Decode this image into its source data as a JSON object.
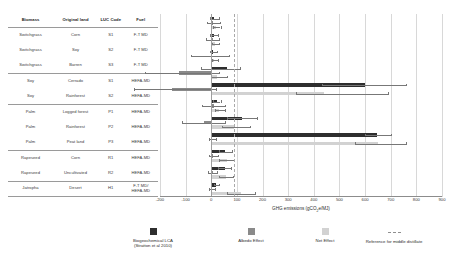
{
  "table": {
    "headers": [
      "Biomass",
      "Original land",
      "LUC Code",
      "Fuel"
    ],
    "rows": [
      {
        "biomass": "Switchgrass",
        "land": "Corn",
        "luc": "S1",
        "fuel": "F-T MD",
        "fuel2": ""
      },
      {
        "biomass": "Switchgrass",
        "land": "Soy",
        "luc": "S2",
        "fuel": "F-T MD",
        "fuel2": ""
      },
      {
        "biomass": "Switchgrass",
        "land": "Barren",
        "luc": "S3",
        "fuel": "F-T MD",
        "fuel2": ""
      },
      {
        "biomass": "Soy",
        "land": "Cerrado",
        "luc": "S1",
        "fuel": "HEFA-MD",
        "fuel2": ""
      },
      {
        "biomass": "Soy",
        "land": "Rainforest",
        "luc": "S2",
        "fuel": "HEFA-MD",
        "fuel2": ""
      },
      {
        "biomass": "Palm",
        "land": "Logged forest",
        "luc": "P1",
        "fuel": "HEFA-MD",
        "fuel2": ""
      },
      {
        "biomass": "Palm",
        "land": "Rainforest",
        "luc": "P2",
        "fuel": "HEFA-MD",
        "fuel2": ""
      },
      {
        "biomass": "Palm",
        "land": "Peat land",
        "luc": "P3",
        "fuel": "HEFA-MD",
        "fuel2": ""
      },
      {
        "biomass": "Rapeseed",
        "land": "Corn",
        "luc": "R1",
        "fuel": "HEFA-MD",
        "fuel2": ""
      },
      {
        "biomass": "Rapeseed",
        "land": "Uncultivated",
        "luc": "R2",
        "fuel": "HEFA-MD",
        "fuel2": ""
      },
      {
        "biomass": "Jatropha",
        "land": "Desert",
        "luc": "H1",
        "fuel": "F-T MD/",
        "fuel2": "HEFA-MD"
      }
    ]
  },
  "chart_data": {
    "type": "bar",
    "orientation": "horizontal",
    "title": "",
    "xlabel": "GHG emissions (gCO2e/MJ)",
    "xlabel_parts": {
      "pre": "GHG emissions (gCO",
      "sub": "2",
      "post": "e/MJ)"
    },
    "ylabel": "",
    "xlim": [
      -200,
      900
    ],
    "xticks": [
      -200,
      -100,
      0,
      100,
      200,
      300,
      400,
      500,
      600,
      700,
      800,
      900
    ],
    "grid": "vertical",
    "legend_position": "bottom",
    "reference_line": {
      "label": "Reference for middle distillate",
      "value": 90,
      "style": "dashed"
    },
    "categories": [
      "S1",
      "S2",
      "S3",
      "S1",
      "S2",
      "P1",
      "P2",
      "P3",
      "R1",
      "R2",
      "H1"
    ],
    "series": [
      {
        "name": "Biogeochemical LCA (Stratton et al 2010)",
        "color": "#2e2e2e",
        "values": [
          12,
          10,
          8,
          60,
          600,
          22,
          120,
          645,
          55,
          52,
          20
        ],
        "err_low": [
          -6,
          -4,
          -4,
          -40,
          430,
          8,
          60,
          600,
          30,
          28,
          10
        ],
        "err_high": [
          30,
          26,
          24,
          112,
          760,
          36,
          180,
          700,
          80,
          78,
          32
        ]
      },
      {
        "name": "Albedo Effect",
        "color": "#8a8a8a",
        "values": [
          8,
          6,
          4,
          -125,
          -155,
          10,
          -30,
          4,
          8,
          6,
          4
        ],
        "err_low": [
          -18,
          -20,
          -78,
          -260,
          -300,
          -38,
          -115,
          -10,
          -10,
          -12,
          -8
        ],
        "err_high": [
          34,
          32,
          70,
          30,
          20,
          55,
          52,
          18,
          26,
          24,
          16
        ]
      },
      {
        "name": "Net Effect",
        "color": "#d2d2d2",
        "values": [
          20,
          16,
          12,
          22,
          440,
          32,
          90,
          650,
          62,
          58,
          115
        ],
        "err_low": [
          6,
          4,
          2,
          0,
          330,
          14,
          40,
          560,
          32,
          30,
          60
        ],
        "err_high": [
          36,
          30,
          26,
          60,
          690,
          52,
          150,
          760,
          90,
          86,
          170
        ]
      }
    ],
    "legend": [
      {
        "label_line1": "Biogeochemical LCA",
        "label_line2": "(Stratton et al 2010)",
        "swatch": "dark"
      },
      {
        "label_line1": "Albedo Effect",
        "label_line2": "",
        "swatch": "medium"
      },
      {
        "label_line1": "Net Effect",
        "label_line2": "",
        "swatch": "light"
      },
      {
        "label_line1": "Reference for middle distillate",
        "label_line2": "",
        "swatch": "dashed-line"
      }
    ]
  }
}
